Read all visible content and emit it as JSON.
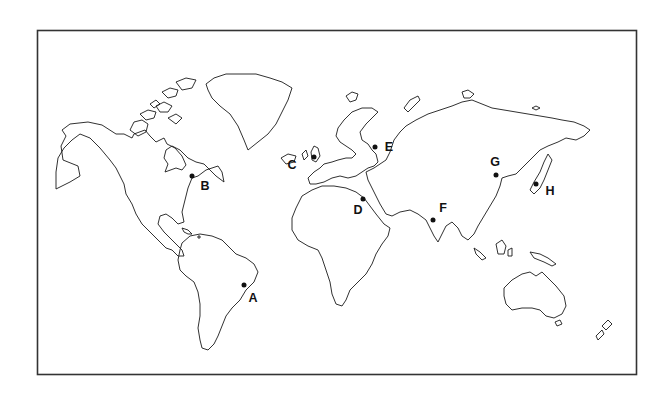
{
  "map": {
    "title": "World map with labeled locations",
    "frame": {
      "x": 37,
      "y": 24,
      "width": 600,
      "height": 351
    },
    "colors": {
      "background": "#ffffff",
      "outline": "#1a1a1a",
      "marker": "#111111"
    }
  },
  "points": [
    {
      "id": "A",
      "label": "A",
      "x": 244,
      "y": 285,
      "label_x": 253,
      "label_y": 298,
      "region": "southeast coast of South America"
    },
    {
      "id": "B",
      "label": "B",
      "x": 192,
      "y": 176,
      "label_x": 205,
      "label_y": 186,
      "region": "east coast of North America"
    },
    {
      "id": "C",
      "label": "C",
      "x": 314,
      "y": 157,
      "label_x": 292,
      "label_y": 165,
      "region": "British Isles"
    },
    {
      "id": "D",
      "label": "D",
      "x": 363,
      "y": 199,
      "label_x": 358,
      "label_y": 210,
      "region": "eastern Mediterranean / Nile delta"
    },
    {
      "id": "E",
      "label": "E",
      "x": 375,
      "y": 147,
      "label_x": 389,
      "label_y": 147,
      "region": "eastern Europe / western Russia"
    },
    {
      "id": "F",
      "label": "F",
      "x": 433,
      "y": 220,
      "label_x": 443,
      "label_y": 208,
      "region": "west coast of India"
    },
    {
      "id": "G",
      "label": "G",
      "x": 496,
      "y": 175,
      "label_x": 495,
      "label_y": 162,
      "region": "northern China"
    },
    {
      "id": "H",
      "label": "H",
      "x": 536,
      "y": 184,
      "label_x": 550,
      "label_y": 191,
      "region": "Japan"
    }
  ]
}
